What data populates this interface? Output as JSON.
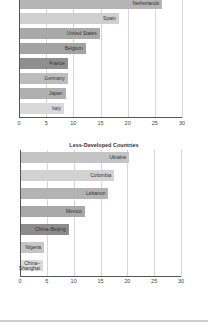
{
  "chart_data": [
    {
      "type": "bar",
      "orientation": "horizontal",
      "title": "",
      "categories": [
        "Netherlands",
        "Spain",
        "United States",
        "Belgium",
        "France",
        "Germany",
        "Japan",
        "Italy"
      ],
      "values": [
        26.2,
        18.2,
        14.7,
        12.1,
        8.8,
        8.8,
        8.4,
        8.1
      ],
      "colors": [
        "#b5b5b5",
        "#cfcfcf",
        "#a9a9a9",
        "#a3a3a3",
        "#8f8f8f",
        "#bdbdbd",
        "#b0b0b0",
        "#d9d9d9"
      ],
      "xlabel": "",
      "ylabel": "",
      "xlim": [
        0,
        30
      ],
      "xticks": [
        "0",
        "5",
        "10",
        "15",
        "20",
        "25",
        "30"
      ],
      "grid": true,
      "legend": "none"
    },
    {
      "type": "bar",
      "orientation": "horizontal",
      "title": "Less-Developed Countries",
      "categories": [
        "Ukraine",
        "Colombia",
        "Lebanon",
        "Mexico",
        "China–Beijing",
        "Nigeria",
        "China–Shanghai"
      ],
      "labels": [
        "Ukraine",
        "Colombia",
        "Lebanon",
        "Mexico",
        "China–Beijing",
        "Nigeria",
        "China–\nShanghai"
      ],
      "values": [
        20.2,
        17.4,
        16.3,
        11.9,
        8.9,
        4.3,
        4.1
      ],
      "colors": [
        "#c4c4c4",
        "#d2d2d2",
        "#b3b3b3",
        "#a8a8a8",
        "#8c8c8c",
        "#c6c6c6",
        "#d9d9d9"
      ],
      "xlabel": "",
      "ylabel": "",
      "xlim": [
        0,
        30
      ],
      "xticks": [
        "0",
        "5",
        "10",
        "15",
        "20",
        "25",
        "30"
      ],
      "grid": true,
      "legend": "none"
    }
  ],
  "chart2_title": "Less-Developed Countries"
}
